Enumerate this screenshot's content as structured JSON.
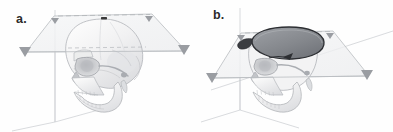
{
  "figure": {
    "type": "anatomical-illustration",
    "view": "lateral-oblique",
    "background_color": "#fefefe",
    "panel_count": 2
  },
  "panels": [
    {
      "id": "a",
      "label": "a.",
      "description": "Skull in lateral oblique view intersected by a horizontal cutting plane",
      "elements": {
        "cutting_plane": "horizontal-transparent-parallelogram",
        "plane_fill": "#f2f3f4",
        "plane_stroke": "#b9bcc0",
        "axis_stroke": "#c2c5c9",
        "arrow_fill": "#9a9da2",
        "arrow_count": 4,
        "dashed_guide": true,
        "vertex_marker": true,
        "vertex_marker_color": "#3a3a3a",
        "skull_outline": "#b0b3b8",
        "skull_fill": "#f6f6f7",
        "skull_shade": "#dcdde0"
      }
    },
    {
      "id": "b",
      "label": "b.",
      "description": "Skull with calvaria removed exposing the cranial cavity floor",
      "elements": {
        "cutting_plane": "horizontal-transparent-parallelogram",
        "plane_fill": "#f2f3f4",
        "plane_stroke": "#b9bcc0",
        "axis_stroke": "#c2c5c9",
        "arrow_fill": "#9a9da2",
        "arrow_count": 4,
        "dashed_guide": true,
        "cranial_cavity_fill": "#8e9196",
        "cranial_cavity_rim": "#2d2f33",
        "skull_outline": "#b0b3b8",
        "skull_fill": "#f6f6f7",
        "skull_shade": "#dcdde0"
      }
    }
  ],
  "colors": {
    "background": "#fefefe",
    "label_text": "#2b2b2b",
    "line_light": "#c9ccd0",
    "line_mid": "#b0b3b8",
    "line_dark": "#2d2f33",
    "arrow": "#9a9da2",
    "plane": "#f2f3f4",
    "cavity": "#8e9196"
  }
}
